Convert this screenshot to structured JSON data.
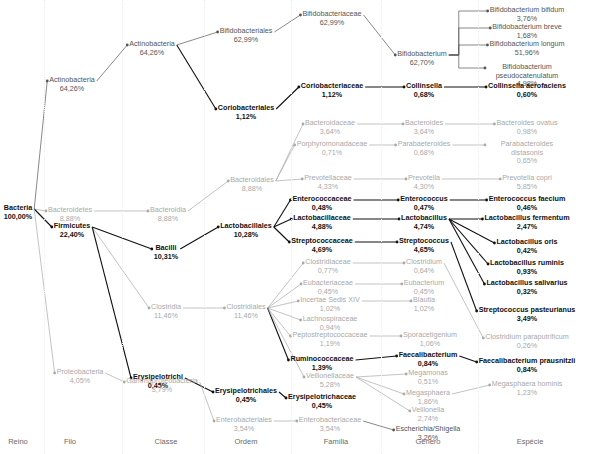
{
  "columns": [
    "Reino",
    "Filo",
    "Classe",
    "Ordem",
    "Família",
    "Gênero",
    "Espécie"
  ],
  "colors": {
    "highlight": "#111111",
    "dim": "#a9a9a9",
    "mid": "#555555",
    "grid": "#eeeeee"
  },
  "nodes": [
    {
      "id": "bacteria",
      "name": "Bacteria",
      "value": "100,00%",
      "level": 0,
      "style": "hl"
    },
    {
      "id": "actinobacteria_f",
      "name": "Actinobacteria",
      "value": "64,26%",
      "level": 1,
      "style": "mid",
      "parent": "bacteria"
    },
    {
      "id": "bacteroidetes",
      "name": "Bacteroidetes",
      "value": "8,88%",
      "level": 1,
      "style": "dim",
      "parent": "bacteria"
    },
    {
      "id": "firmicutes",
      "name": "Firmicutes",
      "value": "22,40%",
      "level": 1,
      "style": "hl",
      "parent": "bacteria"
    },
    {
      "id": "proteobacteria",
      "name": "Proteobacteria",
      "value": "4,05%",
      "level": 1,
      "style": "dim",
      "parent": "bacteria"
    },
    {
      "id": "actinobacteria_c",
      "name": "Actinobacteria",
      "value": "64,26%",
      "level": 2,
      "style": "mid",
      "parent": "actinobacteria_f"
    },
    {
      "id": "bacteroidia",
      "name": "Bacteroidia",
      "value": "8,88%",
      "level": 2,
      "style": "dim",
      "parent": "bacteroidetes"
    },
    {
      "id": "bacilli",
      "name": "Bacilli",
      "value": "10,31%",
      "level": 2,
      "style": "hl",
      "parent": "firmicutes"
    },
    {
      "id": "clostridia",
      "name": "Clostridia",
      "value": "11,46%",
      "level": 2,
      "style": "dim",
      "parent": "firmicutes"
    },
    {
      "id": "erysipelotrichi",
      "name": "Erysipelotrichi",
      "value": "0,45%",
      "level": 2,
      "style": "hl",
      "parent": "firmicutes"
    },
    {
      "id": "gammaproteobacteria",
      "name": "Gammaproteobacteria",
      "value": "3,79%",
      "level": 2,
      "style": "dim",
      "parent": "proteobacteria"
    },
    {
      "id": "bifidobacteriales",
      "name": "Bifidobacteriales",
      "value": "62,99%",
      "level": 3,
      "style": "mid",
      "parent": "actinobacteria_c"
    },
    {
      "id": "coriobacteriales",
      "name": "Coriobacteriales",
      "value": "1,12%",
      "level": 3,
      "style": "hl",
      "parent": "actinobacteria_c"
    },
    {
      "id": "bacteroidales",
      "name": "Bacteroidales",
      "value": "8,88%",
      "level": 3,
      "style": "dim",
      "parent": "bacteroidia"
    },
    {
      "id": "lactobacillales",
      "name": "Lactobacillales",
      "value": "10,28%",
      "level": 3,
      "style": "hl",
      "parent": "bacilli"
    },
    {
      "id": "clostridiales",
      "name": "Clostridiales",
      "value": "11,46%",
      "level": 3,
      "style": "dim",
      "parent": "clostridia"
    },
    {
      "id": "erysipelotrichales",
      "name": "Erysipelotrichales",
      "value": "0,45%",
      "level": 3,
      "style": "hl",
      "parent": "erysipelotrichi"
    },
    {
      "id": "enterobacteriales",
      "name": "Enterobacteriales",
      "value": "3,54%",
      "level": 3,
      "style": "dim",
      "parent": "gammaproteobacteria"
    },
    {
      "id": "bifidobacteriaceae",
      "name": "Bifidobacteriaceae",
      "value": "62,99%",
      "level": 4,
      "style": "mid",
      "parent": "bifidobacteriales"
    },
    {
      "id": "coriobacteriaceae",
      "name": "Coriobacteriaceae",
      "value": "1,12%",
      "level": 4,
      "style": "hl",
      "parent": "coriobacteriales"
    },
    {
      "id": "bacteroidaceae",
      "name": "Bacteroidaceae",
      "value": "3,64%",
      "level": 4,
      "style": "dim",
      "parent": "bacteroidales"
    },
    {
      "id": "porphyromonadaceae",
      "name": "Porphyromonadaceae",
      "value": "0,71%",
      "level": 4,
      "style": "dim",
      "parent": "bacteroidales"
    },
    {
      "id": "prevotellaceae",
      "name": "Prevotellaceae",
      "value": "4,33%",
      "level": 4,
      "style": "dim",
      "parent": "bacteroidales"
    },
    {
      "id": "enterococcaceae",
      "name": "Enterococcaceae",
      "value": "0,48%",
      "level": 4,
      "style": "hl",
      "parent": "lactobacillales"
    },
    {
      "id": "lactobacillaceae",
      "name": "Lactobacillaceae",
      "value": "4,88%",
      "level": 4,
      "style": "hl",
      "parent": "lactobacillales"
    },
    {
      "id": "streptococcaceae",
      "name": "Streptococcaceae",
      "value": "4,69%",
      "level": 4,
      "style": "hl",
      "parent": "lactobacillales"
    },
    {
      "id": "clostridiaceae",
      "name": "Clostridiaceae",
      "value": "0,77%",
      "level": 4,
      "style": "dim",
      "parent": "clostridiales"
    },
    {
      "id": "eubacteriaceae",
      "name": "Eubacteriaceae",
      "value": "0,45%",
      "level": 4,
      "style": "dim",
      "parent": "clostridiales"
    },
    {
      "id": "incertae",
      "name": "Incertae Sedis XIV",
      "value": "1,02%",
      "level": 4,
      "style": "dim",
      "parent": "clostridiales"
    },
    {
      "id": "lachnospiraceae",
      "name": "Lachnospiraceae",
      "value": "0,94%",
      "level": 4,
      "style": "dim",
      "parent": "clostridiales"
    },
    {
      "id": "peptostreptococcaceae",
      "name": "Peptostreptococcaceae",
      "value": "1,19%",
      "level": 4,
      "style": "dim",
      "parent": "clostridiales"
    },
    {
      "id": "ruminococcaceae",
      "name": "Ruminococcaceae",
      "value": "1,39%",
      "level": 4,
      "style": "hl",
      "parent": "clostridiales"
    },
    {
      "id": "veillonellaceae",
      "name": "Veillonellaceae",
      "value": "5,28%",
      "level": 4,
      "style": "dim",
      "parent": "clostridiales"
    },
    {
      "id": "erysipelotrichaceae",
      "name": "Erysipelotrichaceae",
      "value": "0,45%",
      "level": 4,
      "style": "hl",
      "parent": "erysipelotrichales"
    },
    {
      "id": "enterobacteriaceae",
      "name": "Enterobacteriaceae",
      "value": "3,54%",
      "level": 4,
      "style": "dim",
      "parent": "enterobacteriales"
    },
    {
      "id": "bifidobacterium",
      "name": "Bifidobacterium",
      "value": "62,70%",
      "level": 5,
      "style": "mid",
      "parent": "bifidobacteriaceae"
    },
    {
      "id": "collinsella",
      "name": "Collinsella",
      "value": "0,68%",
      "level": 5,
      "style": "hl",
      "parent": "coriobacteriaceae"
    },
    {
      "id": "bacteroides",
      "name": "Bacteroides",
      "value": "3,64%",
      "level": 5,
      "style": "dim",
      "parent": "bacteroidaceae"
    },
    {
      "id": "parabaeteroides",
      "name": "Parabaeteroides",
      "value": "0,68%",
      "level": 5,
      "style": "dim",
      "parent": "porphyromonadaceae"
    },
    {
      "id": "prevotella",
      "name": "Prevotella",
      "value": "4,30%",
      "level": 5,
      "style": "dim",
      "parent": "prevotellaceae"
    },
    {
      "id": "enterococcus",
      "name": "Enterococcus",
      "value": "0,47%",
      "level": 5,
      "style": "hl",
      "parent": "enterococcaceae"
    },
    {
      "id": "lactobacillus",
      "name": "Lactobacillus",
      "value": "4,74%",
      "level": 5,
      "style": "hl",
      "parent": "lactobacillaceae"
    },
    {
      "id": "streptococcus",
      "name": "Streptococcus",
      "value": "4,65%",
      "level": 5,
      "style": "hl",
      "parent": "streptococcaceae"
    },
    {
      "id": "clostridium",
      "name": "Clostridium",
      "value": "0,64%",
      "level": 5,
      "style": "dim",
      "parent": "clostridiaceae"
    },
    {
      "id": "eubacterium",
      "name": "Eubacterium",
      "value": "0,45%",
      "level": 5,
      "style": "dim",
      "parent": "eubacteriaceae"
    },
    {
      "id": "blautia",
      "name": "Blautia",
      "value": "1,02%",
      "level": 5,
      "style": "dim",
      "parent": "incertae"
    },
    {
      "id": "sporacetigenium",
      "name": "Sporacetigenium",
      "value": "1,06%",
      "level": 5,
      "style": "dim",
      "parent": "peptostreptococcaceae"
    },
    {
      "id": "faecalibacterium",
      "name": "Faecalibacterium",
      "value": "0,84%",
      "level": 5,
      "style": "hl",
      "parent": "ruminococcaceae"
    },
    {
      "id": "megamonas",
      "name": "Megamonas",
      "value": "0,51%",
      "level": 5,
      "style": "dim",
      "parent": "veillonellaceae"
    },
    {
      "id": "megasphaera",
      "name": "Megasphaera",
      "value": "1,86%",
      "level": 5,
      "style": "dim",
      "parent": "veillonellaceae"
    },
    {
      "id": "veillonella",
      "name": "Veillonella",
      "value": "2,74%",
      "level": 5,
      "style": "dim",
      "parent": "veillonellaceae"
    },
    {
      "id": "escherichia",
      "name": "Escherichia/Shigella",
      "value": "3,26%",
      "level": 5,
      "style": "mid",
      "parent": "enterobacteriaceae"
    },
    {
      "id": "b_bifidum",
      "name": "Bifidobacterium bifidum",
      "value": "3,76%",
      "level": 6,
      "style": "mid",
      "parent": "bifidobacterium"
    },
    {
      "id": "b_breve",
      "name": "Bifidobacterium breve",
      "value": "1,68%",
      "level": 6,
      "style": "mid",
      "parent": "bifidobacterium"
    },
    {
      "id": "b_longum",
      "name": "Bifidobacterium longum",
      "value": "51,96%",
      "level": 6,
      "style": "mid",
      "parent": "bifidobacterium"
    },
    {
      "id": "b_pseudo",
      "name": "Bifidobacterium pseudocatenulatum",
      "value": "4,98%",
      "level": 6,
      "style": "mid",
      "parent": "bifidobacterium"
    },
    {
      "id": "c_aerofaciens",
      "name": "Collinsella aerofaciens",
      "value": "0,60%",
      "level": 6,
      "style": "hl",
      "parent": "collinsella"
    },
    {
      "id": "b_ovatus",
      "name": "Bacteroides ovatus",
      "value": "0,98%",
      "level": 6,
      "style": "dim",
      "parent": "bacteroides"
    },
    {
      "id": "p_distasonis",
      "name": "Parabacteroides distasonis",
      "value": "0,65%",
      "level": 6,
      "style": "dim",
      "parent": "parabaeteroides"
    },
    {
      "id": "p_copri",
      "name": "Prevotella copri",
      "value": "5,85%",
      "level": 6,
      "style": "dim",
      "parent": "prevotella"
    },
    {
      "id": "e_faecium",
      "name": "Enterococcus faecium",
      "value": "0,46%",
      "level": 6,
      "style": "hl",
      "parent": "enterococcus"
    },
    {
      "id": "l_fermentum",
      "name": "Lactobacillus fermentum",
      "value": "2,47%",
      "level": 6,
      "style": "hl",
      "parent": "lactobacillus"
    },
    {
      "id": "l_oris",
      "name": "Lactobacillus oris",
      "value": "0,42%",
      "level": 6,
      "style": "hl",
      "parent": "lactobacillus"
    },
    {
      "id": "l_ruminis",
      "name": "Lactobacillus ruminis",
      "value": "0,93%",
      "level": 6,
      "style": "hl",
      "parent": "lactobacillus"
    },
    {
      "id": "l_salivarius",
      "name": "Lactobacillus salivarius",
      "value": "0,32%",
      "level": 6,
      "style": "hl",
      "parent": "lactobacillus"
    },
    {
      "id": "s_pasteurianus",
      "name": "Streptococcus pasteurianus",
      "value": "3,49%",
      "level": 6,
      "style": "hl",
      "parent": "streptococcus"
    },
    {
      "id": "c_paraputrificum",
      "name": "Clostridium paraputrificum",
      "value": "0,26%",
      "level": 6,
      "style": "dim",
      "parent": "clostridium"
    },
    {
      "id": "f_prausnitzii",
      "name": "Faecalibacterium prausnitzii",
      "value": "0,84%",
      "level": 6,
      "style": "hl",
      "parent": "faecalibacterium"
    },
    {
      "id": "m_hominis",
      "name": "Megasphaera hominis",
      "value": "1,23%",
      "level": 6,
      "style": "dim",
      "parent": "megasphaera"
    }
  ]
}
